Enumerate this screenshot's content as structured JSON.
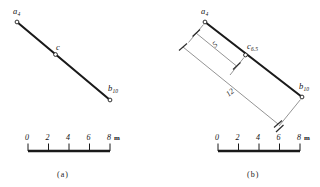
{
  "figure": {
    "title_a": "(a)",
    "title_b": "(b)",
    "unit_symbol": "m"
  },
  "panel_a": {
    "caption": "(a)",
    "points": [
      {
        "id": "a",
        "label": "a",
        "subscript": "4",
        "value": 4
      },
      {
        "id": "c",
        "label": "c",
        "subscript": "",
        "value": null
      },
      {
        "id": "b",
        "label": "b",
        "subscript": "10",
        "value": 10
      }
    ],
    "scale": {
      "ticks": [
        "0",
        "2",
        "4",
        "6",
        "8"
      ],
      "unit": "m",
      "min": 0,
      "max": 8
    }
  },
  "panel_b": {
    "caption": "(b)",
    "points": [
      {
        "id": "a",
        "label": "a",
        "subscript": "4",
        "value": 4
      },
      {
        "id": "c",
        "label": "c",
        "subscript": "6.5",
        "value": 6.5
      },
      {
        "id": "b",
        "label": "b",
        "subscript": "10",
        "value": 10
      }
    ],
    "dimensions": [
      {
        "id": "short",
        "value": "5"
      },
      {
        "id": "long",
        "value": "12"
      }
    ],
    "scale": {
      "ticks": [
        "0",
        "2",
        "4",
        "6",
        "8"
      ],
      "unit": "m",
      "min": 0,
      "max": 8,
      "indicator_at": "6"
    }
  },
  "style": {
    "ink": "#141414",
    "line": "#1f1f1f",
    "thin": "#4a4a4a"
  }
}
